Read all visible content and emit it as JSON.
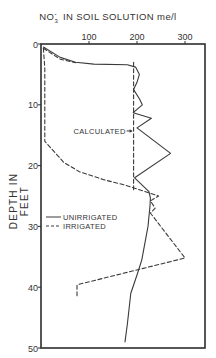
{
  "chart_data": {
    "type": "line",
    "title_parts": {
      "species": "NO",
      "subscript": "3",
      "superscript": "-",
      "rest": "IN SOIL SOLUTION me/l"
    },
    "xlabel": "NO3- in soil solution (me/l)",
    "ylabel": "DEPTH IN FEET",
    "x_axis_position": "top",
    "y_axis_inverted": true,
    "xlim": [
      0,
      340
    ],
    "ylim": [
      0,
      50
    ],
    "x_ticks": [
      0,
      100,
      200,
      300
    ],
    "x_tick_labels": [
      "100",
      "200",
      "300"
    ],
    "y_ticks": [
      0,
      10,
      20,
      30,
      40,
      50
    ],
    "y_tick_labels": [
      "0",
      "10",
      "20",
      "30",
      "40",
      "50"
    ],
    "grid": false,
    "legend": {
      "position": "center-left",
      "entries": [
        {
          "label": "UNIRRIGATED",
          "style": "solid"
        },
        {
          "label": "IRRIGATED",
          "style": "dashed"
        }
      ]
    },
    "annotations": [
      {
        "text": "CALCULATED",
        "arrow": "right",
        "at": {
          "x": 193,
          "depth": 14.3
        }
      }
    ],
    "series": [
      {
        "name": "UNIRRIGATED",
        "style": "solid",
        "points": [
          {
            "x": 5,
            "depth": 0.5
          },
          {
            "x": 40,
            "depth": 2.2
          },
          {
            "x": 72,
            "depth": 3.0
          },
          {
            "x": 110,
            "depth": 3.3
          },
          {
            "x": 180,
            "depth": 3.4
          },
          {
            "x": 197,
            "depth": 3.8
          },
          {
            "x": 205,
            "depth": 5.0
          },
          {
            "x": 200,
            "depth": 6.3
          },
          {
            "x": 193,
            "depth": 7.5
          },
          {
            "x": 205,
            "depth": 9.0
          },
          {
            "x": 211,
            "depth": 10.0
          },
          {
            "x": 192,
            "depth": 11.3
          },
          {
            "x": 230,
            "depth": 12.2
          },
          {
            "x": 200,
            "depth": 13.8
          },
          {
            "x": 270,
            "depth": 18.0
          },
          {
            "x": 195,
            "depth": 22.0
          },
          {
            "x": 225,
            "depth": 24.3
          },
          {
            "x": 228,
            "depth": 25.3
          },
          {
            "x": 227,
            "depth": 26.6
          },
          {
            "x": 223,
            "depth": 30.0
          },
          {
            "x": 210,
            "depth": 35.5
          },
          {
            "x": 200,
            "depth": 38.0
          },
          {
            "x": 187,
            "depth": 41.0
          },
          {
            "x": 180,
            "depth": 46.0
          },
          {
            "x": 175,
            "depth": 49.0
          }
        ]
      },
      {
        "name": "IRRIGATED",
        "style": "dashed",
        "points": [
          {
            "x": 5,
            "depth": 0.7
          },
          {
            "x": 8,
            "depth": 4.0
          },
          {
            "x": 8,
            "depth": 10.0
          },
          {
            "x": 8,
            "depth": 16.0
          },
          {
            "x": 48,
            "depth": 19.5
          },
          {
            "x": 80,
            "depth": 21.0
          },
          {
            "x": 130,
            "depth": 22.3
          },
          {
            "x": 175,
            "depth": 23.2
          },
          {
            "x": 245,
            "depth": 25.0
          },
          {
            "x": 228,
            "depth": 25.8
          },
          {
            "x": 238,
            "depth": 27.0
          },
          {
            "x": 228,
            "depth": 27.8
          },
          {
            "x": 300,
            "depth": 35.2
          },
          {
            "x": 75,
            "depth": 39.6
          },
          {
            "x": 75,
            "depth": 41.5
          }
        ]
      },
      {
        "name": "CALCULATED",
        "style": "dashed",
        "points": [
          {
            "x": 193,
            "depth": 3.0
          },
          {
            "x": 193,
            "depth": 24.0
          }
        ]
      },
      {
        "name": "IRRIGATED-initial-curve",
        "style": "dashed",
        "points": [
          {
            "x": 5,
            "depth": 0.7
          },
          {
            "x": 40,
            "depth": 2.5
          },
          {
            "x": 72,
            "depth": 3.1
          }
        ]
      }
    ]
  },
  "plot_geometry": {
    "left": 41,
    "top": 44,
    "right": 205,
    "bottom": 348,
    "px_per_unit_x": 0.48,
    "px_per_foot": 6.08
  },
  "colors": {
    "line": "#3a3a3a",
    "axis": "#2e2e2e",
    "background": "#ffffff"
  }
}
